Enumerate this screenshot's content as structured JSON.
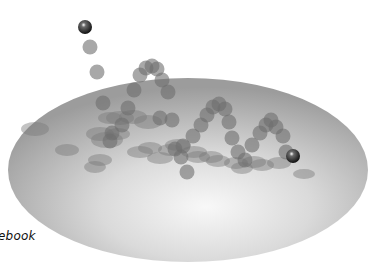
{
  "caption": {
    "text": "ebook"
  },
  "colors": {
    "background": "#ffffff",
    "plane_edge": "#9a9a9a",
    "plane_center": "#f2f2f2",
    "ghost_ball": "#6e6e6e",
    "shadow": "#7a7a7a",
    "solid_ball": "#1e1e1e",
    "highlight": "#ffffff"
  },
  "plane": {
    "cx": 188,
    "cy": 170,
    "rx": 180,
    "ry": 92
  },
  "solid_balls": [
    {
      "name": "start-ball",
      "x": 85,
      "y": 27,
      "r": 7
    },
    {
      "name": "end-ball",
      "x": 293,
      "y": 156,
      "r": 7
    }
  ],
  "ghost_balls": [
    [
      90,
      47
    ],
    [
      97,
      72
    ],
    [
      103,
      103
    ],
    [
      112,
      133
    ],
    [
      110,
      141
    ],
    [
      122,
      125
    ],
    [
      128,
      108
    ],
    [
      134,
      90
    ],
    [
      140,
      75
    ],
    [
      146,
      68
    ],
    [
      152,
      66
    ],
    [
      157,
      69
    ],
    [
      162,
      80
    ],
    [
      168,
      92
    ],
    [
      172,
      120
    ],
    [
      175,
      149
    ],
    [
      181,
      157
    ],
    [
      187,
      172
    ],
    [
      183,
      146
    ],
    [
      193,
      136
    ],
    [
      201,
      125
    ],
    [
      207,
      115
    ],
    [
      213,
      107
    ],
    [
      219,
      104
    ],
    [
      225,
      109
    ],
    [
      229,
      122
    ],
    [
      232,
      138
    ],
    [
      238,
      152
    ],
    [
      245,
      160
    ],
    [
      252,
      145
    ],
    [
      260,
      133
    ],
    [
      266,
      125
    ],
    [
      271,
      120
    ],
    [
      276,
      127
    ],
    [
      283,
      136
    ],
    [
      286,
      152
    ],
    [
      160,
      118
    ]
  ],
  "shadows": [
    [
      35,
      129,
      14,
      7
    ],
    [
      67,
      150,
      12,
      6
    ],
    [
      100,
      134,
      14,
      7
    ],
    [
      107,
      140,
      16,
      8
    ],
    [
      118,
      134,
      12,
      6
    ],
    [
      100,
      160,
      12,
      6
    ],
    [
      95,
      167,
      11,
      6
    ],
    [
      140,
      152,
      13,
      6
    ],
    [
      150,
      148,
      12,
      6
    ],
    [
      160,
      158,
      13,
      6
    ],
    [
      170,
      150,
      12,
      6
    ],
    [
      178,
      145,
      13,
      6
    ],
    [
      194,
      152,
      13,
      6
    ],
    [
      198,
      157,
      12,
      6
    ],
    [
      211,
      157,
      12,
      6
    ],
    [
      218,
      161,
      12,
      6
    ],
    [
      236,
      163,
      12,
      6
    ],
    [
      242,
      168,
      11,
      6
    ],
    [
      254,
      162,
      12,
      6
    ],
    [
      262,
      165,
      12,
      6
    ],
    [
      279,
      163,
      12,
      6
    ],
    [
      304,
      174,
      11,
      5
    ],
    [
      120,
      118,
      14,
      7
    ],
    [
      133,
      117,
      14,
      7
    ],
    [
      148,
      122,
      14,
      7
    ],
    [
      110,
      118,
      12,
      6
    ]
  ]
}
